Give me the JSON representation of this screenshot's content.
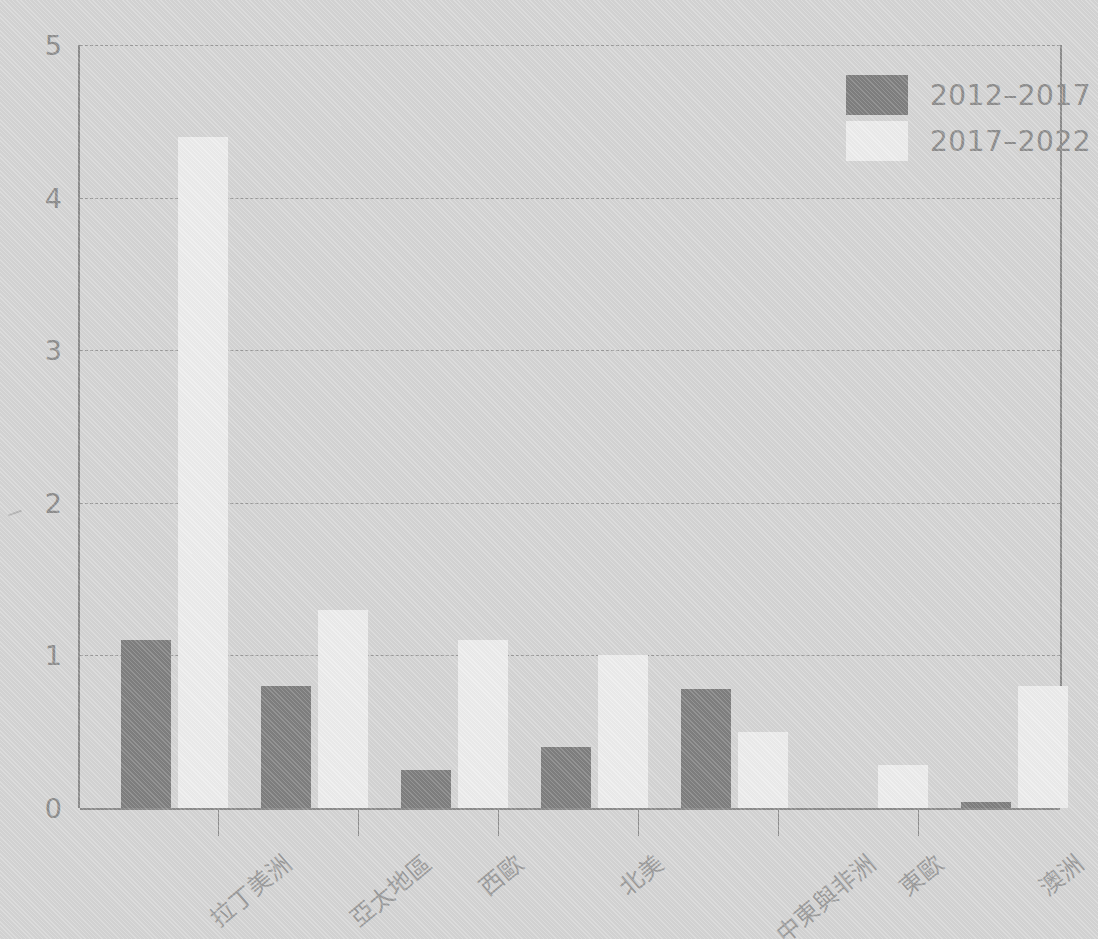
{
  "chart_data": {
    "type": "bar",
    "title": "",
    "xlabel": "",
    "ylabel": "",
    "ylim": [
      0,
      5
    ],
    "yticks": [
      0,
      1,
      2,
      3,
      4,
      5
    ],
    "ytick_labels": [
      "0",
      "1",
      "2",
      "3",
      "4",
      "5"
    ],
    "grid": true,
    "grid_style": "dashed-horizontal",
    "legend_position": "top-right",
    "categories": [
      "拉丁美洲",
      "亞太地區",
      "西歐",
      "北美",
      "中東與非洲",
      "東歐",
      "澳洲"
    ],
    "series": [
      {
        "name": "2012–2017",
        "color": "#808080",
        "values": [
          1.1,
          0.8,
          0.25,
          0.4,
          0.78,
          0.0,
          0.04
        ]
      },
      {
        "name": "2017–2022",
        "color": "#ededed",
        "values": [
          4.4,
          1.3,
          1.1,
          1.0,
          0.5,
          0.28,
          0.8
        ]
      }
    ]
  },
  "legend": {
    "entries": [
      {
        "label": "2012–2017",
        "color": "#808080"
      },
      {
        "label": "2017–2022",
        "color": "#ededed"
      }
    ]
  },
  "colors": {
    "background": "#d5d5d5",
    "axis": "#8c8c8c",
    "gridline": "#9a9a9a",
    "tick_label": "#8d8d8d",
    "category_label": "#9b9b9b",
    "series_0": "#808080",
    "series_1": "#ededed"
  }
}
